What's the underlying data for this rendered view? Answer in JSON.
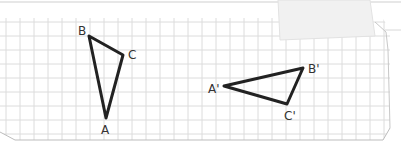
{
  "figure": {
    "grid": {
      "spacing_px": 14,
      "line_color": "#dcdcdc",
      "paper_color": "#ffffff"
    },
    "stroke_color": "#222222",
    "triangles": [
      {
        "name": "original",
        "vertices": [
          {
            "label": "A",
            "x": 106,
            "y": 118,
            "lx": 101,
            "ly": 134
          },
          {
            "label": "B",
            "x": 89,
            "y": 36,
            "lx": 78,
            "ly": 35
          },
          {
            "label": "C",
            "x": 123,
            "y": 55,
            "lx": 128,
            "ly": 59
          }
        ]
      },
      {
        "name": "image",
        "vertices": [
          {
            "label": "A'",
            "x": 224,
            "y": 86,
            "lx": 208,
            "ly": 93
          },
          {
            "label": "B'",
            "x": 303,
            "y": 68,
            "lx": 308,
            "ly": 73
          },
          {
            "label": "C'",
            "x": 287,
            "y": 104,
            "lx": 284,
            "ly": 120
          }
        ]
      }
    ]
  }
}
